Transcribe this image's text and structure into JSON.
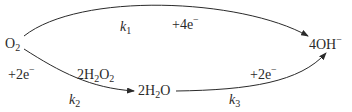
{
  "diagram": {
    "type": "reaction-pathway",
    "nodes": {
      "o2": {
        "base": "O",
        "sub": "2",
        "sup": ""
      },
      "h2o2": {
        "coef": "2",
        "base1": "H",
        "sub1": "2",
        "base2": "O",
        "sub2": "2"
      },
      "h2o": {
        "coef": "2",
        "base1": "H",
        "sub1": "2",
        "base2": "O"
      },
      "oh": {
        "coef": "4",
        "base": "OH",
        "sup": "−"
      }
    },
    "edges": [
      {
        "from": "O2",
        "to": "4OH−",
        "rate": {
          "k": "k",
          "sub": "1"
        },
        "electrons": {
          "text": "+4e",
          "sup": "−"
        }
      },
      {
        "from": "O2",
        "to": "2H2O (via 2H2O2)",
        "rate": {
          "k": "k",
          "sub": "2"
        },
        "electrons": {
          "text": "+2e",
          "sup": "−"
        }
      },
      {
        "from": "2H2O",
        "to": "4OH−",
        "rate": {
          "k": "k",
          "sub": "3"
        },
        "electrons": {
          "text": "+2e",
          "sup": "−"
        }
      }
    ],
    "colors": {
      "stroke": "#2a2a2a",
      "text": "#2a2a2a",
      "background": "#ffffff"
    }
  }
}
